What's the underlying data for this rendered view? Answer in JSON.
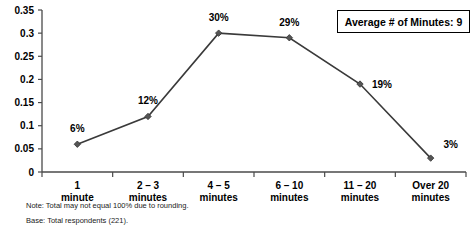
{
  "chart_data": {
    "type": "line",
    "title": "",
    "xlabel": "",
    "ylabel": "",
    "categories": [
      "1 minute",
      "2 – 3 minutes",
      "4 – 5 minutes",
      "6 – 10 minutes",
      "11 – 20 minutes",
      "Over 20 minutes"
    ],
    "category_lines": [
      [
        "1",
        "minute"
      ],
      [
        "2 – 3",
        "minutes"
      ],
      [
        "4 – 5",
        "minutes"
      ],
      [
        "6 – 10",
        "minutes"
      ],
      [
        "11 – 20",
        "minutes"
      ],
      [
        "Over 20",
        "minutes"
      ]
    ],
    "values": [
      0.06,
      0.12,
      0.3,
      0.29,
      0.19,
      0.03
    ],
    "point_labels": [
      "6%",
      "12%",
      "30%",
      "29%",
      "19%",
      "3%"
    ],
    "ylim": [
      0,
      0.35
    ],
    "ytick_values": [
      0,
      0.05,
      0.1,
      0.15,
      0.2,
      0.25,
      0.3,
      0.35
    ],
    "ytick_labels": [
      "0",
      "0.05",
      "0.1",
      "0.15",
      "0.2",
      "0.25",
      "0.3",
      "0.35"
    ],
    "grid": false,
    "legend": "none",
    "series_color": "#3a3a3a",
    "marker_color": "#555555",
    "axis_color": "#4a4a4a"
  },
  "annotation": {
    "average_box_label": "Average # of Minutes: 9"
  },
  "footnotes": {
    "note": "Note: Total may not equal 100% due to rounding.",
    "base": "Base: Total respondents (221)."
  }
}
